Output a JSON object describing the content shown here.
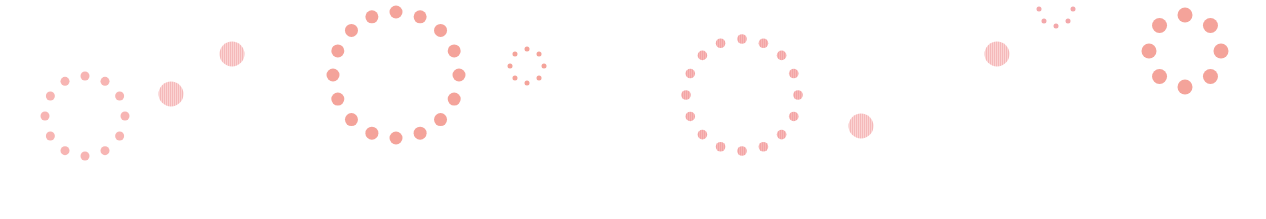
{
  "scene": {
    "width": 1266,
    "height": 219,
    "background": "#ffffff",
    "colors": {
      "dot_strong": "#f4a39a",
      "dot_light": "#f7b5b3",
      "dot_soft": "#f3a8ab",
      "stripe_fill": "#fbd3d3",
      "stripe_line": "#f5b9ba"
    },
    "rings": [
      {
        "name": "dot-ring-small-left",
        "cx": 85,
        "cy": 116,
        "radius": 40,
        "count": 12,
        "dot_r": 4.5,
        "color": "dot_light",
        "striped": false,
        "offset_deg": -90
      },
      {
        "name": "dot-ring-large",
        "cx": 396,
        "cy": 75,
        "radius": 63,
        "count": 16,
        "dot_r": 6.5,
        "color": "dot_strong",
        "striped": false,
        "offset_deg": -90
      },
      {
        "name": "dot-ring-tiny",
        "cx": 527,
        "cy": 66,
        "radius": 17,
        "count": 8,
        "dot_r": 2.5,
        "color": "dot_strong",
        "striped": false,
        "offset_deg": -90
      },
      {
        "name": "dot-ring-striped",
        "cx": 742,
        "cy": 95,
        "radius": 56,
        "count": 16,
        "dot_r": 4.8,
        "color": "dot_light",
        "striped": true,
        "offset_deg": -90
      },
      {
        "name": "dot-ring-tiny-top",
        "cx": 1056,
        "cy": 9,
        "radius": 17,
        "count": 8,
        "dot_r": 2.5,
        "color": "dot_soft",
        "striped": false,
        "offset_deg": -90
      },
      {
        "name": "dot-ring-bold-right",
        "cx": 1185,
        "cy": 51,
        "radius": 36,
        "count": 8,
        "dot_r": 7.5,
        "color": "dot_strong",
        "striped": false,
        "offset_deg": -90
      }
    ],
    "striped_circles": [
      {
        "name": "striped-circle-1",
        "cx": 232,
        "cy": 54,
        "r": 12.5
      },
      {
        "name": "striped-circle-2",
        "cx": 171,
        "cy": 94,
        "r": 12.5
      },
      {
        "name": "striped-circle-3",
        "cx": 861,
        "cy": 126,
        "r": 12.5
      },
      {
        "name": "striped-circle-4",
        "cx": 997,
        "cy": 54,
        "r": 12.5
      }
    ]
  }
}
